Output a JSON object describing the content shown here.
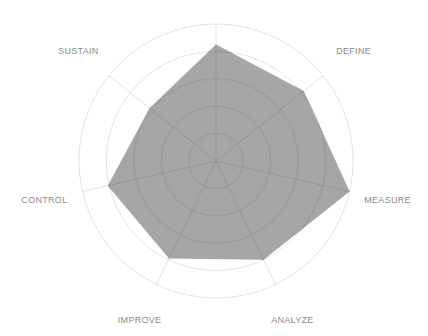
{
  "chart_data": {
    "type": "radar",
    "title": "",
    "axes": [
      "",
      "DEFINE",
      "MEASURE",
      "ANALYZE",
      "IMPROVE",
      "CONTROL",
      "SUSTAIN"
    ],
    "series": [
      {
        "name": "Score",
        "values": [
          0.85,
          0.82,
          1.0,
          0.8,
          0.79,
          0.81,
          0.62
        ]
      }
    ],
    "range": [
      0,
      1
    ],
    "rings": 5,
    "grid": true,
    "legend": "none",
    "colors": {
      "fill": "#a6a6a6",
      "grid_outer": "#dcdcdc",
      "grid_inner": "#8f8f8f",
      "label": "#8a8a8a"
    }
  },
  "layout": {
    "cx": 216,
    "cy": 161,
    "radius": 137,
    "label_radius": 176
  }
}
